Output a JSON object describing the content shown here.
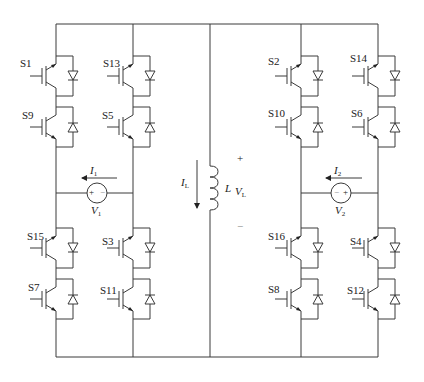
{
  "switches": {
    "left_outer": {
      "top": "S1",
      "upper_mid": "S9",
      "lower_mid": "S15",
      "bottom": "S7"
    },
    "left_inner": {
      "top": "S13",
      "upper_mid": "S5",
      "lower_mid": "S3",
      "bottom": "S11"
    },
    "right_inner": {
      "top": "S2",
      "upper_mid": "S10",
      "lower_mid": "S16",
      "bottom": "S8"
    },
    "right_outer": {
      "top": "S14",
      "upper_mid": "S6",
      "lower_mid": "S4",
      "bottom": "S12"
    }
  },
  "sources": {
    "v1": {
      "current": "I",
      "current_sub": "1",
      "voltage": "V",
      "voltage_sub": "1",
      "pos_sign": "+",
      "neg_sign": "−"
    },
    "v2": {
      "current": "I",
      "current_sub": "2",
      "voltage": "V",
      "voltage_sub": "2",
      "pos_sign": "+",
      "neg_sign": "−"
    }
  },
  "inductor": {
    "name": "L",
    "current": "I",
    "current_sub": "L",
    "voltage": "V",
    "voltage_sub": "L",
    "plus": "+",
    "minus": "−"
  },
  "colors": {
    "wire": "#3a3a3a",
    "text": "#222222",
    "background": "#ffffff"
  }
}
